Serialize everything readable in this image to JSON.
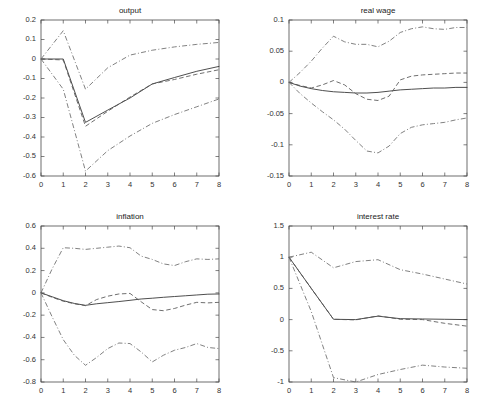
{
  "figure": {
    "width": 497,
    "height": 414,
    "background": "#ffffff",
    "layout": "2x2 grid of impulse response panels"
  },
  "style": {
    "solid_color": "#3a3a3a",
    "dashed_color": "#555555",
    "dashdot_color": "#6a6a6a",
    "axis_color": "#4a4a4a"
  },
  "chart_data": [
    {
      "type": "line",
      "title": "output",
      "xlabel": "",
      "ylabel": "",
      "xlim": [
        0,
        8
      ],
      "ylim": [
        -0.6,
        0.2
      ],
      "xticks": [
        0,
        1,
        2,
        3,
        4,
        5,
        6,
        7,
        8
      ],
      "yticks": [
        0.2,
        0.1,
        0,
        -0.1,
        -0.2,
        -0.3,
        -0.4,
        -0.5,
        -0.6
      ],
      "xticklabels": [
        "0",
        "1",
        "2",
        "3",
        "4",
        "5",
        "6",
        "7",
        "8"
      ],
      "yticklabels": [
        "0.2",
        "0.1",
        "0",
        "-0.1",
        "-0.2",
        "-0.3",
        "-0.4",
        "-0.5",
        "-0.6"
      ],
      "grid": false,
      "legend": "none",
      "x": [
        0,
        1,
        2,
        3,
        4,
        5,
        6,
        7,
        8
      ],
      "series": [
        {
          "name": "point estimate",
          "style": "solid",
          "values": [
            0.0,
            0.0,
            -0.325,
            -0.262,
            -0.2,
            -0.128,
            -0.095,
            -0.063,
            -0.038
          ]
        },
        {
          "name": "alternative estimate",
          "style": "dashed",
          "values": [
            0.0,
            -0.005,
            -0.345,
            -0.268,
            -0.195,
            -0.128,
            -0.105,
            -0.078,
            -0.055
          ]
        },
        {
          "name": "upper confidence band",
          "style": "dashdot",
          "values": [
            0.0,
            0.145,
            -0.155,
            -0.045,
            0.02,
            0.045,
            0.062,
            0.075,
            0.085
          ]
        },
        {
          "name": "lower confidence band",
          "style": "dashdot",
          "values": [
            0.0,
            -0.155,
            -0.575,
            -0.47,
            -0.395,
            -0.33,
            -0.285,
            -0.245,
            -0.205
          ]
        }
      ]
    },
    {
      "type": "line",
      "title": "real wage",
      "xlabel": "",
      "ylabel": "",
      "xlim": [
        0,
        8
      ],
      "ylim": [
        -0.15,
        0.1
      ],
      "xticks": [
        0,
        1,
        2,
        3,
        4,
        5,
        6,
        7,
        8
      ],
      "yticks": [
        0.1,
        0.05,
        0,
        -0.05,
        -0.1,
        -0.15
      ],
      "xticklabels": [
        "0",
        "1",
        "2",
        "3",
        "4",
        "5",
        "6",
        "7",
        "8"
      ],
      "yticklabels": [
        "0.1",
        "0.05",
        "0",
        "-0.05",
        "-0.1",
        "-0.15"
      ],
      "grid": false,
      "legend": "none",
      "x": [
        0,
        0.5,
        1,
        1.5,
        2,
        2.5,
        3,
        3.5,
        4,
        4.5,
        5,
        5.5,
        6,
        6.5,
        7,
        7.5,
        8
      ],
      "series": [
        {
          "name": "point estimate",
          "style": "solid",
          "values": [
            0.0,
            -0.006,
            -0.01,
            -0.013,
            -0.015,
            -0.016,
            -0.017,
            -0.017,
            -0.016,
            -0.014,
            -0.012,
            -0.011,
            -0.01,
            -0.009,
            -0.009,
            -0.008,
            -0.008
          ]
        },
        {
          "name": "alternative estimate",
          "style": "dashed",
          "values": [
            0.0,
            -0.005,
            -0.009,
            -0.004,
            0.003,
            -0.004,
            -0.018,
            -0.027,
            -0.029,
            -0.022,
            0.004,
            0.01,
            0.012,
            0.013,
            0.014,
            0.015,
            0.015
          ]
        },
        {
          "name": "upper confidence band",
          "style": "dashdot",
          "values": [
            0.0,
            0.016,
            0.034,
            0.055,
            0.074,
            0.065,
            0.061,
            0.061,
            0.057,
            0.066,
            0.08,
            0.086,
            0.089,
            0.086,
            0.085,
            0.088,
            0.088
          ]
        },
        {
          "name": "lower confidence band",
          "style": "dashdot",
          "values": [
            0.0,
            -0.018,
            -0.033,
            -0.047,
            -0.06,
            -0.075,
            -0.093,
            -0.11,
            -0.113,
            -0.102,
            -0.082,
            -0.072,
            -0.068,
            -0.066,
            -0.064,
            -0.06,
            -0.057
          ]
        }
      ]
    },
    {
      "type": "line",
      "title": "inflation",
      "xlabel": "",
      "ylabel": "",
      "xlim": [
        0,
        8
      ],
      "ylim": [
        -0.8,
        0.6
      ],
      "xticks": [
        0,
        1,
        2,
        3,
        4,
        5,
        6,
        7,
        8
      ],
      "yticks": [
        0.6,
        0.4,
        0.2,
        0,
        -0.2,
        -0.4,
        -0.6,
        -0.8
      ],
      "xticklabels": [
        "0",
        "1",
        "2",
        "3",
        "4",
        "5",
        "6",
        "7",
        "8"
      ],
      "yticklabels": [
        "0.6",
        "0.4",
        "0.2",
        "0",
        "-0.2",
        "-0.4",
        "-0.6",
        "-0.8"
      ],
      "grid": false,
      "legend": "none",
      "x": [
        0,
        0.5,
        1,
        1.5,
        2,
        2.5,
        3,
        3.5,
        4,
        4.5,
        5,
        5.5,
        6,
        6.5,
        7,
        7.5,
        8
      ],
      "series": [
        {
          "name": "point estimate",
          "style": "solid",
          "values": [
            0.0,
            -0.035,
            -0.07,
            -0.095,
            -0.112,
            -0.098,
            -0.088,
            -0.078,
            -0.067,
            -0.055,
            -0.048,
            -0.04,
            -0.033,
            -0.026,
            -0.019,
            -0.012,
            -0.01
          ]
        },
        {
          "name": "alternative estimate",
          "style": "dashed",
          "values": [
            0.0,
            -0.04,
            -0.075,
            -0.098,
            -0.115,
            -0.06,
            -0.03,
            -0.01,
            -0.005,
            -0.08,
            -0.15,
            -0.16,
            -0.14,
            -0.11,
            -0.085,
            -0.09,
            -0.085
          ]
        },
        {
          "name": "upper confidence band",
          "style": "dashdot",
          "values": [
            0.0,
            0.215,
            0.405,
            0.4,
            0.39,
            0.4,
            0.41,
            0.42,
            0.405,
            0.33,
            0.3,
            0.26,
            0.245,
            0.28,
            0.305,
            0.3,
            0.305
          ]
        },
        {
          "name": "lower confidence band",
          "style": "dashdot",
          "values": [
            0.0,
            -0.215,
            -0.42,
            -0.56,
            -0.65,
            -0.58,
            -0.5,
            -0.45,
            -0.455,
            -0.53,
            -0.62,
            -0.56,
            -0.515,
            -0.49,
            -0.455,
            -0.49,
            -0.5
          ]
        }
      ]
    },
    {
      "type": "line",
      "title": "interest rate",
      "xlabel": "",
      "ylabel": "",
      "xlim": [
        0,
        8
      ],
      "ylim": [
        -1,
        1.5
      ],
      "xticks": [
        0,
        1,
        2,
        3,
        4,
        5,
        6,
        7,
        8
      ],
      "yticks": [
        1.5,
        1,
        0.5,
        0,
        -0.5,
        -1
      ],
      "xticklabels": [
        "0",
        "1",
        "2",
        "3",
        "4",
        "5",
        "6",
        "7",
        "8"
      ],
      "yticklabels": [
        "1.5",
        "1",
        "0.5",
        "0",
        "-0.5",
        "-1"
      ],
      "grid": false,
      "legend": "none",
      "x": [
        0,
        1,
        2,
        3,
        4,
        5,
        6,
        7,
        8
      ],
      "series": [
        {
          "name": "point estimate",
          "style": "solid",
          "values": [
            1.0,
            0.5,
            0.005,
            0.0,
            0.055,
            0.015,
            0.01,
            0.005,
            0.0
          ]
        },
        {
          "name": "alternative estimate",
          "style": "dashed",
          "values": [
            1.0,
            0.5,
            0.005,
            -0.005,
            0.06,
            0.005,
            0.0,
            -0.06,
            -0.105
          ]
        },
        {
          "name": "upper confidence band",
          "style": "dashdot",
          "values": [
            1.0,
            1.08,
            0.83,
            0.93,
            0.96,
            0.8,
            0.73,
            0.65,
            0.57
          ]
        },
        {
          "name": "lower confidence band",
          "style": "dashdot",
          "values": [
            1.0,
            0.13,
            -0.93,
            -1.0,
            -0.88,
            -0.8,
            -0.73,
            -0.76,
            -0.78
          ]
        }
      ]
    }
  ],
  "panels": [
    {
      "id": "output",
      "position": {
        "left": 0,
        "top": 0,
        "width": 249,
        "height": 208
      }
    },
    {
      "id": "real-wage",
      "position": {
        "left": 248,
        "top": 0,
        "width": 249,
        "height": 208
      }
    },
    {
      "id": "inflation",
      "position": {
        "left": 0,
        "top": 206,
        "width": 249,
        "height": 208
      }
    },
    {
      "id": "interest-rate",
      "position": {
        "left": 248,
        "top": 206,
        "width": 249,
        "height": 208
      }
    }
  ]
}
